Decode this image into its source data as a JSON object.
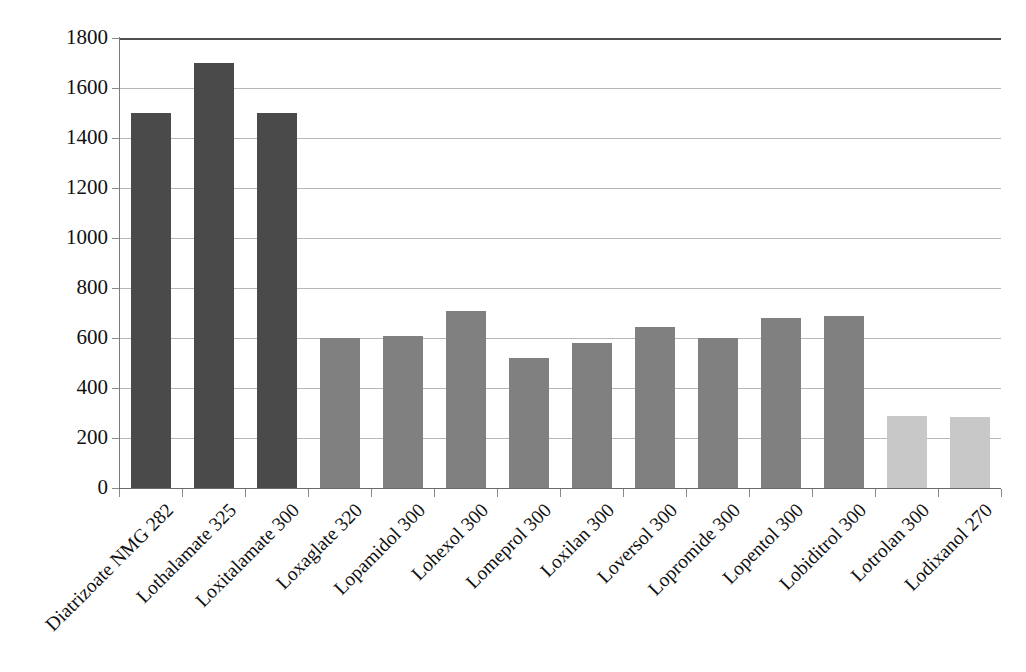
{
  "chart_data": {
    "type": "bar",
    "title": "",
    "subtitle": "",
    "xlabel": "",
    "ylabel": "",
    "ylim": [
      0,
      1800
    ],
    "ytick_step": 200,
    "yticks": [
      "0",
      "200",
      "400",
      "600",
      "800",
      "1000",
      "1200",
      "1400",
      "1600",
      "1800"
    ],
    "grid": "horizontal",
    "legend": "none",
    "categories": [
      "Diatrizoate NMG 282",
      "Lothalamate 325",
      "Loxitalamate 300",
      "Loxaglate 320",
      "Lopamidol 300",
      "Lohexol 300",
      "Lomeprol 300",
      "Loxilan 300",
      "Loversol 300",
      "Lopromide 300",
      "Lopentol 300",
      "Lobiditrol 300",
      "Lotrolan 300",
      "Lodixanol 270"
    ],
    "values": [
      1500,
      1700,
      1500,
      600,
      610,
      710,
      520,
      580,
      645,
      600,
      680,
      690,
      290,
      285
    ],
    "bar_colors": [
      "#4a4a4a",
      "#4a4a4a",
      "#4a4a4a",
      "#808080",
      "#808080",
      "#808080",
      "#808080",
      "#808080",
      "#808080",
      "#808080",
      "#808080",
      "#808080",
      "#c8c8c8",
      "#c8c8c8"
    ]
  },
  "colors": {
    "background": "#ffffff",
    "gridline": "#b7b7b7",
    "axis": "#6a6a6a",
    "frame": "#4f4f4f",
    "text": "#101010",
    "bar_dark": "#4a4a4a",
    "bar_medium": "#808080",
    "bar_light": "#c8c8c8"
  }
}
